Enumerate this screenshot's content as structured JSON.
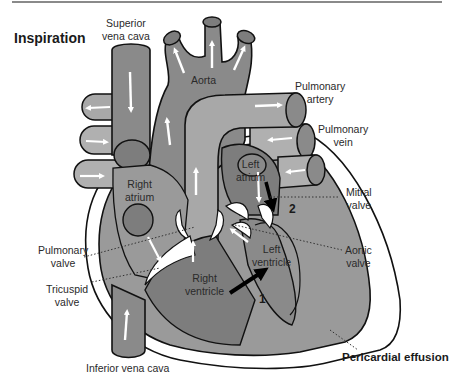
{
  "title": "Inspiration",
  "labels": {
    "superior_vena_cava": "Superior vena cava",
    "superior_vena_cava_l1": "Superior",
    "superior_vena_cava_l2": "vena cava",
    "aorta": "Aorta",
    "pulmonary_artery_l1": "Pulmonary",
    "pulmonary_artery_l2": "artery",
    "pulmonary_vein_l1": "Pulmonary",
    "pulmonary_vein_l2": "vein",
    "left_atrium_l1": "Left",
    "left_atrium_l2": "atrium",
    "right_atrium_l1": "Right",
    "right_atrium_l2": "atrium",
    "mitral_valve_l1": "Mitral",
    "mitral_valve_l2": "valve",
    "aortic_valve_l1": "Aortic",
    "aortic_valve_l2": "valve",
    "pulmonary_valve_l1": "Pulmonary",
    "pulmonary_valve_l2": "valve",
    "tricuspid_valve_l1": "Tricuspid",
    "tricuspid_valve_l2": "valve",
    "left_ventricle_l1": "Left",
    "left_ventricle_l2": "ventricle",
    "right_ventricle_l1": "Right",
    "right_ventricle_l2": "ventricle",
    "inferior_vena_cava": "Inferior vena cava",
    "pericardial_effusion": "Pericardial effusion"
  },
  "markers": {
    "marker_1": "1",
    "marker_2": "2"
  },
  "colors": {
    "background": "#ffffff",
    "outline": "#111111",
    "pericardium_fill": "#ffffff",
    "myocardium": "#9a9a9a",
    "chamber_dark": "#7d7d7d",
    "vessel_light": "#a8a8a8",
    "vessel_end": "#8a8a8a",
    "arrow_white": "#ffffff",
    "arrow_black": "#000000"
  }
}
